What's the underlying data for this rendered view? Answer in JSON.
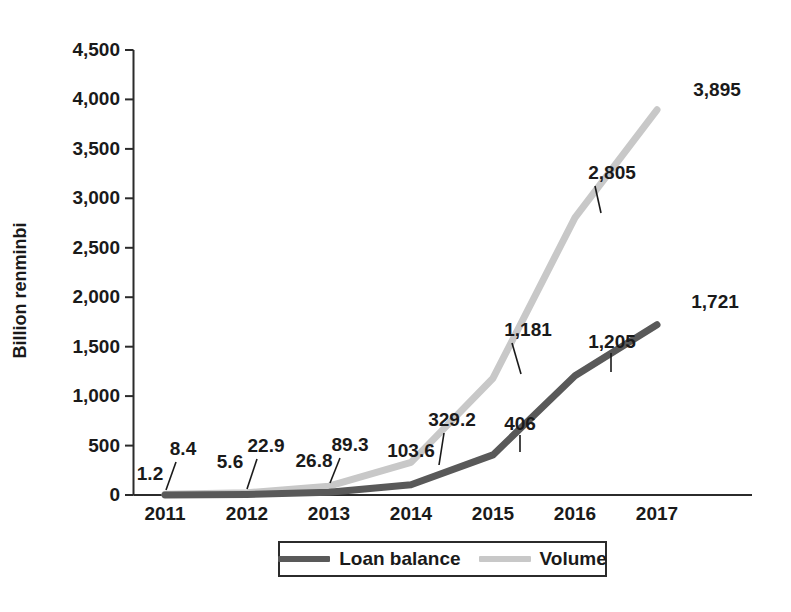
{
  "chart_data": {
    "type": "line",
    "title": "",
    "xlabel": "",
    "ylabel": "Billion renminbi",
    "categories": [
      "2011",
      "2012",
      "2013",
      "2014",
      "2015",
      "2016",
      "2017"
    ],
    "ylim": [
      0,
      4500
    ],
    "yticks": [
      "0",
      "500",
      "1,000",
      "1,500",
      "2,000",
      "2,500",
      "3,000",
      "3,500",
      "4,000",
      "4,500"
    ],
    "ytick_values": [
      0,
      500,
      1000,
      1500,
      2000,
      2500,
      3000,
      3500,
      4000,
      4500
    ],
    "grid": false,
    "legend_position": "bottom",
    "series": [
      {
        "name": "Loan balance",
        "color": "#595959",
        "values": [
          1.2,
          5.6,
          26.8,
          103.6,
          406,
          1205,
          1721
        ],
        "labels": [
          "1.2",
          "5.6",
          "26.8",
          "103.6",
          "406",
          "1,205",
          "1,721"
        ]
      },
      {
        "name": "Volume",
        "color": "#c8c8c8",
        "values": [
          8.4,
          22.9,
          89.3,
          329.2,
          1181,
          2805,
          3895
        ],
        "labels": [
          "8.4",
          "22.9",
          "89.3",
          "329.2",
          "1,181",
          "2,805",
          "3,895"
        ]
      }
    ]
  },
  "axis": {
    "y_title": "Billion renminbi",
    "y_ticks": [
      "4,500",
      "4,000",
      "3,500",
      "3,000",
      "2,500",
      "2,000",
      "1,500",
      "1,000",
      "500",
      "0"
    ],
    "x_ticks": [
      "2011",
      "2012",
      "2013",
      "2014",
      "2015",
      "2016",
      "2017"
    ]
  },
  "labels": {
    "loan": [
      "1.2",
      "5.6",
      "26.8",
      "103.6",
      "406",
      "1,205",
      "1,721"
    ],
    "volume": [
      "8.4",
      "22.9",
      "89.3",
      "329.2",
      "1,181",
      "2,805",
      "3,895"
    ]
  },
  "legend": {
    "items": [
      {
        "label": "Loan balance",
        "color": "#595959"
      },
      {
        "label": "Volume",
        "color": "#c8c8c8"
      }
    ]
  },
  "colors": {
    "loan_balance": "#595959",
    "volume": "#c8c8c8",
    "axis": "#2b2b2b",
    "text": "#1a1a1a",
    "background": "#ffffff"
  }
}
